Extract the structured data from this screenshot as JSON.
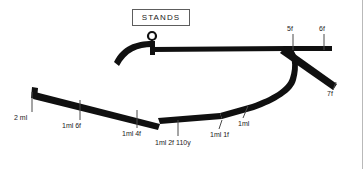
{
  "diagram": {
    "kind": "racecourse-plan",
    "title_box": {
      "label": "STANDS"
    },
    "colors": {
      "track": "#101010",
      "background": "#ffffff",
      "text": "#1c1c1c",
      "box_border": "#5d5d5d",
      "page_border": "#b9b9b9"
    },
    "winning_post": {
      "name": "winning-post-marker"
    },
    "distance_markers": [
      {
        "id": "m-2ml",
        "label": "2 ml",
        "x": 14,
        "y": 118,
        "tick_x": 32,
        "tick_y1": 92,
        "tick_y2": 103
      },
      {
        "id": "m-1ml6f",
        "label": "1ml 6f",
        "x": 62,
        "y": 127,
        "tick_x": 80,
        "tick_y1": 100,
        "tick_y2": 112
      },
      {
        "id": "m-1ml4f",
        "label": "1ml 4f",
        "x": 122,
        "y": 134,
        "tick_x": 137,
        "tick_y1": 108,
        "tick_y2": 119
      },
      {
        "id": "m-1ml2f110y",
        "label": "1ml 2f 110y",
        "x": 156,
        "y": 142,
        "tick_x": 178,
        "tick_y1": 116,
        "tick_y2": 127
      },
      {
        "id": "m-1ml1f",
        "label": "1ml 1f",
        "x": 213,
        "y": 135,
        "tick_x": 218,
        "tick_y1": 113,
        "tick_y2": 124
      },
      {
        "id": "m-1ml",
        "label": "1ml",
        "x": 240,
        "y": 124,
        "tick_x": 243,
        "tick_y1": 103,
        "tick_y2": 115
      },
      {
        "id": "m-5f",
        "label": "5f",
        "x": 287,
        "y": 28,
        "tick_x": 293,
        "tick_y1": 36,
        "tick_y2": 50
      },
      {
        "id": "m-6f",
        "label": "6f",
        "x": 320,
        "y": 28,
        "tick_x": 324,
        "tick_y1": 36,
        "tick_y2": 50
      },
      {
        "id": "m-7f",
        "label": "7f",
        "x": 329,
        "y": 93,
        "tick_x": 334,
        "tick_y1": 78,
        "tick_y2": 89
      }
    ]
  }
}
